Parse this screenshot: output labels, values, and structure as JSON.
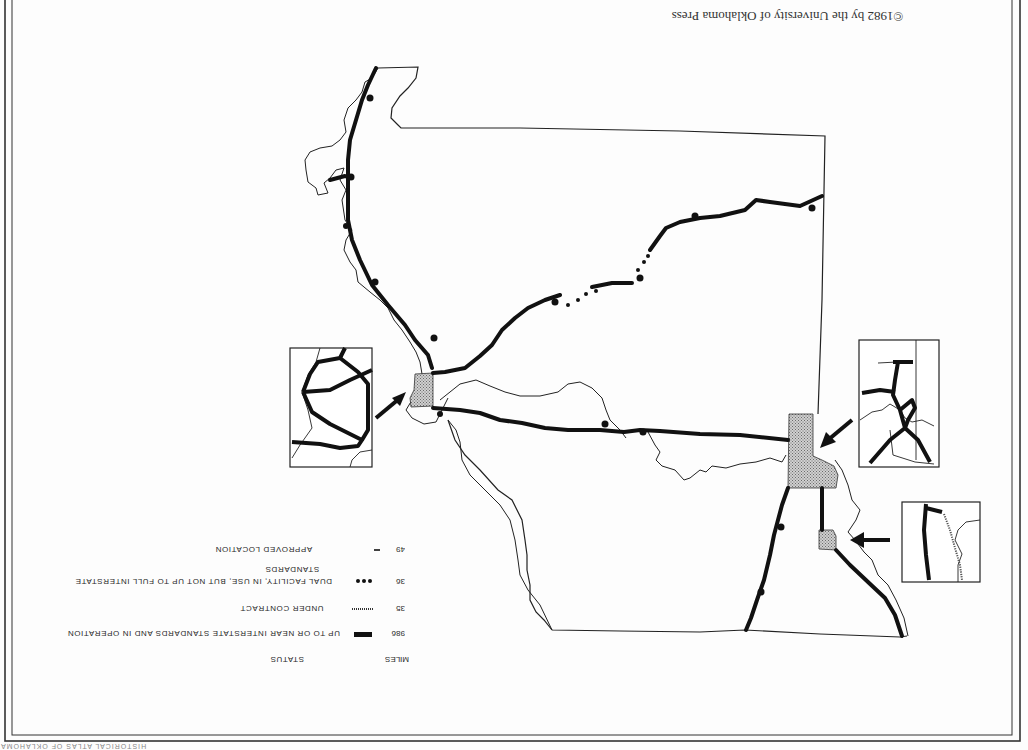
{
  "page": {
    "orientation": "rotated 180 degrees",
    "copyright": "©1982 by the University of Oklahoma Press",
    "footer_strip": "HISTORICAL ATLAS OF OKLAHOMA"
  },
  "map": {
    "subject": "Oklahoma Interstate Highway System status",
    "insets": [
      {
        "id": "inset-oklahoma-city",
        "label": "Oklahoma City area detail"
      },
      {
        "id": "inset-tulsa",
        "label": "Tulsa area detail"
      },
      {
        "id": "inset-lawton",
        "label": "Lawton area detail"
      }
    ],
    "colors": {
      "highway": "#111111",
      "boundary": "#222222",
      "urban_area_fill": "#b8b8b8"
    }
  },
  "legend": {
    "miles_header": "MILES",
    "status_header": "STATUS",
    "items": [
      {
        "miles": "986",
        "symbol": "solid-thick-line",
        "label": "UP TO OR NEAR INTERSTATE STANDARDS AND IN OPERATION"
      },
      {
        "miles": "35",
        "symbol": "hatched-line",
        "label": "UNDER CONTRACT"
      },
      {
        "miles": "36",
        "symbol": "dotted-line",
        "label": "DUAL FACILITY, IN USE, BUT NOT UP TO FULL INTERSTATE",
        "label_line2": "STANDARDS"
      },
      {
        "miles": "49",
        "symbol": "thin-dash",
        "label": "APPROVED LOCATION"
      }
    ]
  }
}
